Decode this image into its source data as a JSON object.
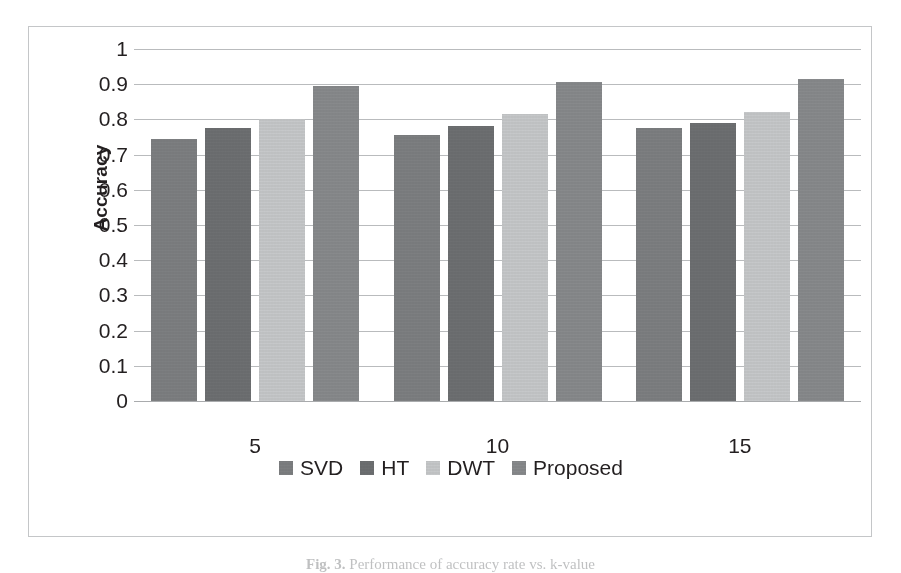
{
  "figure": {
    "caption_prefix": "Fig. 3.",
    "caption_text": "Performance of accuracy rate vs. k-value"
  },
  "axes": {
    "y_title": "Accuracy",
    "y_ticks": [
      "1",
      "0.9",
      "0.8",
      "0.7",
      "0.6",
      "0.5",
      "0.4",
      "0.3",
      "0.2",
      "0.1",
      "0"
    ],
    "x_ticks": [
      "5",
      "10",
      "15"
    ]
  },
  "colors": {
    "svd": "#7f8183",
    "ht": "#6f7173",
    "dwt": "#c9cbcd",
    "proposed": "#8a8c8e",
    "gridline": "#b9bbbd",
    "frame": "#c4c6c8",
    "text": "#231f20"
  },
  "legend": {
    "items": [
      {
        "label": "SVD",
        "color_key": "svd"
      },
      {
        "label": "HT",
        "color_key": "ht"
      },
      {
        "label": "DWT",
        "color_key": "dwt"
      },
      {
        "label": "Proposed",
        "color_key": "proposed"
      }
    ]
  },
  "chart_data": {
    "type": "bar",
    "title": "",
    "xlabel": "",
    "ylabel": "Accuracy",
    "categories": [
      "5",
      "10",
      "15"
    ],
    "ylim": [
      0,
      1
    ],
    "ytick_step": 0.1,
    "grid": true,
    "legend_position": "bottom",
    "series": [
      {
        "name": "SVD",
        "color": "#7f8183",
        "values": [
          0.745,
          0.755,
          0.775
        ]
      },
      {
        "name": "HT",
        "color": "#6f7173",
        "values": [
          0.775,
          0.78,
          0.79
        ]
      },
      {
        "name": "DWT",
        "color": "#c9cbcd",
        "values": [
          0.8,
          0.815,
          0.82
        ]
      },
      {
        "name": "Proposed",
        "color": "#8a8c8e",
        "values": [
          0.895,
          0.905,
          0.915
        ]
      }
    ]
  }
}
